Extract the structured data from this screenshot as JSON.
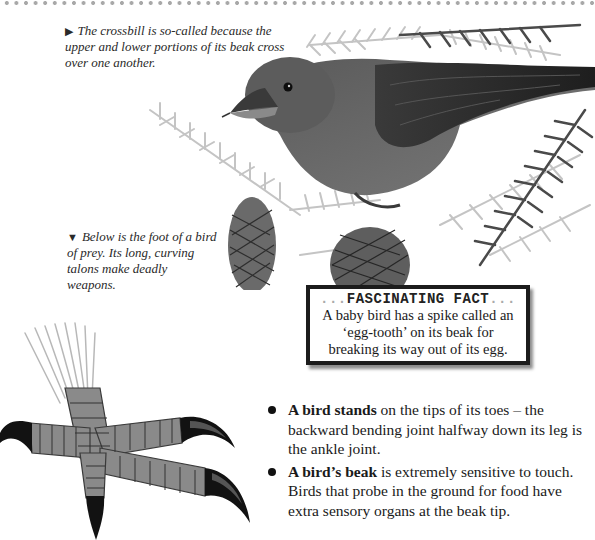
{
  "page": {
    "border_style": "dotted-gray",
    "colors": {
      "text": "#1a1a1a",
      "dots": "#a8a8a8",
      "box_border": "#1c1c1c"
    }
  },
  "captions": {
    "crossbill": {
      "icon": "right-triangle-icon",
      "glyph": "▶",
      "text": "The crossbill is so-called because the upper and lower portions of its beak cross over one another."
    },
    "foot": {
      "icon": "down-triangle-icon",
      "glyph": "▼",
      "text": "Below is the foot of a bird of prey. Its long, curving talons make deadly weapons."
    }
  },
  "fact_box": {
    "title_dots_left": "...",
    "title": "FASCINATING FACT",
    "title_dots_right": "...",
    "body": "A baby bird has a spike called an ‘egg-tooth’ on its beak for breaking its way out of its egg."
  },
  "bullets": [
    {
      "bold": "A bird stands",
      "text": " on the tips of its toes – the backward bending joint halfway down its leg is the ankle joint."
    },
    {
      "bold": "A bird’s beak",
      "text": " is extremely sensitive to touch. Birds that probe in the ground for food have extra sensory organs at the beak tip."
    }
  ],
  "illustrations": {
    "crossbill": "crossbill-on-pine-branch-illustration",
    "talon": "bird-of-prey-foot-illustration"
  }
}
